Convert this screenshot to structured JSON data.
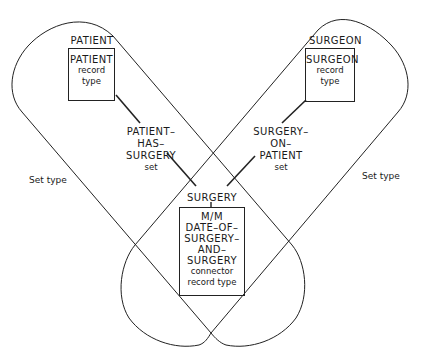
{
  "diagram": {
    "patient": {
      "owner_label": "PATIENT",
      "box_title": "PATIENT",
      "box_sub1": "record",
      "box_sub2": "type"
    },
    "surgeon": {
      "owner_label": "SURGEON",
      "box_title": "SURGEON",
      "box_sub1": "record",
      "box_sub2": "type"
    },
    "set_left": {
      "line1": "PATIENT–",
      "line2": "HAS–",
      "line3": "SURGERY",
      "line4": "set"
    },
    "set_right": {
      "line1": "SURGERY–",
      "line2": "ON–",
      "line3": "PATIENT",
      "line4": "set"
    },
    "connector": {
      "owner_label": "SURGERY",
      "line1": "M/M",
      "line2": "DATE–OF–",
      "line3": "SURGERY–",
      "line4": "AND–",
      "line5": "SURGERY",
      "line6": "connector",
      "line7": "record type"
    },
    "set_type_left": "Set type",
    "set_type_right": "Set type",
    "colors": {
      "line": "#222222",
      "background": "#ffffff"
    }
  }
}
